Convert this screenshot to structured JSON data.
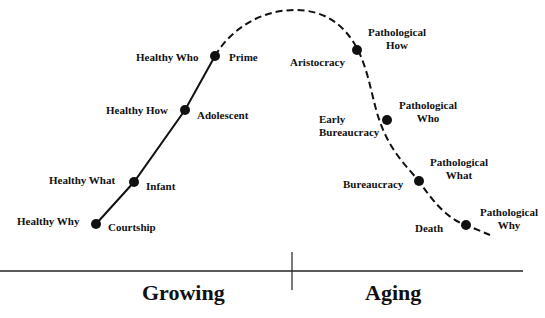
{
  "diagram": {
    "axis": {
      "left_label": "Growing",
      "right_label": "Aging"
    },
    "growing_points": [
      {
        "left": "Healthy Who",
        "right": "Prime"
      },
      {
        "left": "Healthy How",
        "right": "Adolescent"
      },
      {
        "left": "Healthy What",
        "right": "Infant"
      },
      {
        "left": "Healthy Why",
        "right": "Courtship"
      }
    ],
    "aging_points": [
      {
        "stage": "Aristocracy",
        "pathology_l1": "Pathological",
        "pathology_l2": "How"
      },
      {
        "stage_l1": "Early",
        "stage_l2": "Bureaucracy",
        "pathology_l1": "Pathological",
        "pathology_l2": "Who"
      },
      {
        "stage": "Bureaucracy",
        "pathology_l1": "Pathological",
        "pathology_l2": "What"
      },
      {
        "stage": "Death",
        "pathology_l1": "Pathological",
        "pathology_l2": "Why"
      }
    ]
  }
}
